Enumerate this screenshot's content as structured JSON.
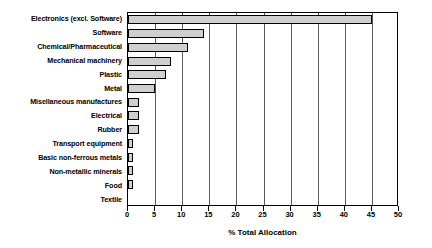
{
  "chart_data": {
    "type": "bar",
    "orientation": "horizontal",
    "title": "",
    "xlabel": "% Total Allocation",
    "ylabel": "",
    "xlim": [
      0,
      50
    ],
    "xticks": [
      0,
      5,
      10,
      15,
      20,
      25,
      30,
      35,
      40,
      45,
      50
    ],
    "grid": true,
    "grid_axis": "x",
    "legend": false,
    "bar_fill_color": "#cfcfcf",
    "bar_edge_color": "#000000",
    "categories": [
      "Electronics (excl. Software)",
      "Software",
      "Chemical/Pharmaceutical",
      "Mechanical machinery",
      "Plastic",
      "Metal",
      "Misellaneous manufactures",
      "Electrical",
      "Rubber",
      "Transport equipment",
      "Basic non-ferrous metals",
      "Non-metallic minerals",
      "Food",
      "Textile"
    ],
    "values": [
      45,
      14,
      11,
      8,
      7,
      5,
      2,
      2,
      2,
      1,
      1,
      1,
      1,
      0
    ]
  }
}
